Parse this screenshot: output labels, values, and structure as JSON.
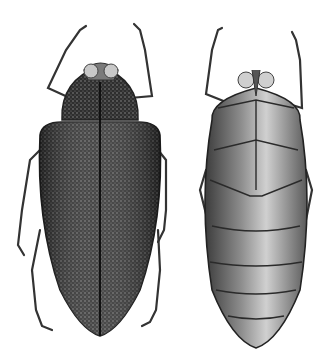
{
  "image": {
    "description": "Scientific illustration of a beetle, dorsal and ventral views",
    "background": "#ffffff",
    "figures": [
      {
        "view": "dorsal",
        "body_color": "#3a3a3a",
        "highlight": "#8a8a8a"
      },
      {
        "view": "ventral",
        "body_color": "#6e6e6e",
        "highlight": "#d4d4d4"
      }
    ]
  }
}
